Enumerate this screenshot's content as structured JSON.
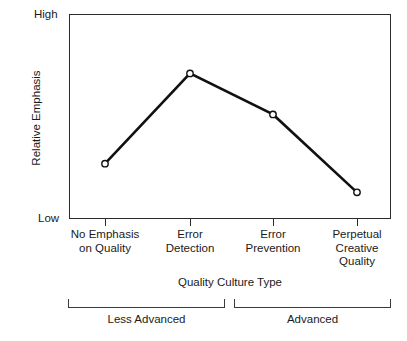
{
  "chart_data": {
    "type": "line",
    "title": "",
    "xlabel": "Quality Culture Type",
    "ylabel": "Relative Emphasis",
    "categories": [
      "No Emphasis\non Quality",
      "Error\nDetection",
      "Error\nPrevention",
      "Perpetual\nCreative\nQuality"
    ],
    "category_lines": [
      [
        "No Emphasis",
        "on Quality"
      ],
      [
        "Error",
        "Detection"
      ],
      [
        "Error",
        "Prevention"
      ],
      [
        "Perpetual",
        "Creative",
        "Quality"
      ]
    ],
    "values": [
      0.27,
      0.71,
      0.51,
      0.13
    ],
    "ylim": [
      0,
      1
    ],
    "ytick_labels": [
      "Low",
      "High"
    ],
    "ytick_low": "Low",
    "ytick_high": "High",
    "grid": false,
    "legend": "none",
    "series": [
      {
        "name": "Relative Emphasis",
        "values": [
          0.27,
          0.71,
          0.51,
          0.13
        ],
        "marker": "open-circle",
        "line_color": "#111111",
        "marker_fill": "#ffffff"
      }
    ],
    "group_brackets": [
      {
        "label": "Less Advanced",
        "span_categories": [
          0,
          1
        ]
      },
      {
        "label": "Advanced",
        "span_categories": [
          2,
          3
        ]
      }
    ],
    "colors": {
      "line": "#111111",
      "marker_fill": "#ffffff",
      "axis": "#2b2b2b",
      "text": "#1a1a1a",
      "background": "#ffffff"
    }
  },
  "labels": {
    "y_axis_title": "Relative Emphasis",
    "y_high": "High",
    "y_low": "Low",
    "x_axis_title": "Quality Culture Type",
    "cat0_line0": "No Emphasis",
    "cat0_line1": "on Quality",
    "cat1_line0": "Error",
    "cat1_line1": "Detection",
    "cat2_line0": "Error",
    "cat2_line1": "Prevention",
    "cat3_line0": "Perpetual",
    "cat3_line1": "Creative",
    "cat3_line2": "Quality",
    "bracket0": "Less Advanced",
    "bracket1": "Advanced"
  }
}
